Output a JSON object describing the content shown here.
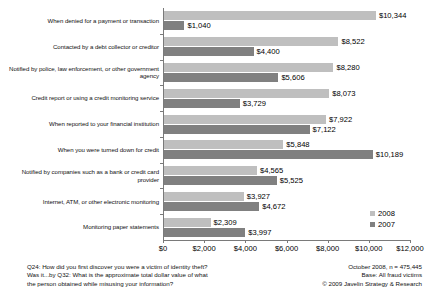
{
  "chart_data": {
    "type": "bar",
    "orientation": "horizontal",
    "title": "",
    "xlabel": "",
    "ylabel": "",
    "xlim": [
      0,
      12000
    ],
    "grid": false,
    "legend_position": "bottom-right",
    "categories": [
      "When denied for a payment or transaction",
      "Contacted by a debt collector or creditor",
      "Notified by police, law enforcement, or other government agency",
      "Credit report or using a credit monitoring service",
      "When reported to your financial institution",
      "When you were turned down for credit",
      "Notified by companies such as a bank or credit card provider",
      "Internet, ATM, or other electronic monitoring",
      "Monitoring paper statements"
    ],
    "series": [
      {
        "name": "2008",
        "color": "#bfbfbf",
        "values": [
          10344,
          8522,
          8280,
          8073,
          7922,
          5848,
          4565,
          3927,
          2309
        ],
        "labels": [
          "$10,344",
          "$8,522",
          "$8,280",
          "$8,073",
          "$7,922",
          "$5,848",
          "$4,565",
          "$3,927",
          "$2,309"
        ]
      },
      {
        "name": "2007",
        "color": "#808080",
        "values": [
          1040,
          4400,
          5606,
          3729,
          7122,
          10189,
          5525,
          4672,
          3997
        ],
        "labels": [
          "$1,040",
          "$4,400",
          "$5,606",
          "$3,729",
          "$7,122",
          "$10,189",
          "$5,525",
          "$4,672",
          "$3,997"
        ]
      }
    ],
    "xticks": [
      0,
      2000,
      4000,
      6000,
      8000,
      10000,
      12000
    ],
    "xtick_labels": [
      "$0",
      "$2,000",
      "$4,000",
      "$6,000",
      "$8,000",
      "$10,000",
      "$12,000"
    ]
  },
  "legend": {
    "items": [
      {
        "label": "2008"
      },
      {
        "label": "2007"
      }
    ]
  },
  "footer": {
    "left": [
      "Q24: How did you first discover you were a victim of identity theft?",
      "Was it...by Q32: What is the approximate total dollar value of what",
      "the person obtained while misusing your information?"
    ],
    "right": [
      "October 2008, n = 475,445",
      "Base: All fraud victims",
      "© 2009 Javelin Strategy & Research"
    ]
  }
}
